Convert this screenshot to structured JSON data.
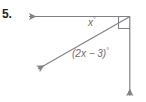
{
  "figure": {
    "problem_number": "5.",
    "stroke_color": "#808285",
    "text_color": "#6d6e71",
    "number_color": "#231f20",
    "labels": {
      "angle_x": "x",
      "angle_x_degree": "°",
      "angle_expression": "(2x − 3)",
      "angle_expression_degree": "°"
    },
    "geometry": {
      "vertex": "(130, 16)",
      "horizontal_ray_endpoint": "(28, 16)",
      "diagonal_ray_endpoint": "(36, 70)",
      "vertical_ray_endpoint": "(130, 98)",
      "right_angle_marker": "true"
    }
  }
}
